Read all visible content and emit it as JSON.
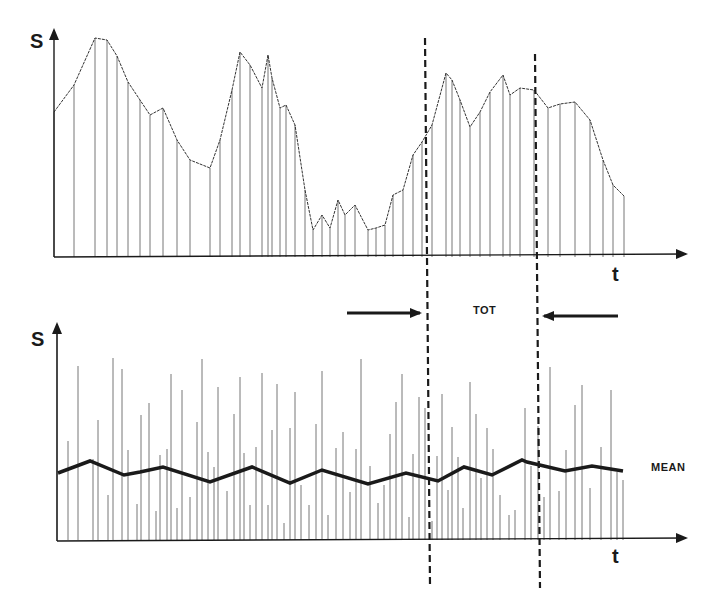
{
  "figure": {
    "top_panel": {
      "y_axis_label": "S",
      "x_axis_label": "t"
    },
    "bottom_panel": {
      "y_axis_label": "S",
      "x_axis_label": "t",
      "mean_label": "MEAN"
    },
    "window_label": "TOT",
    "colors": {
      "ink": "#1a1a1a",
      "stem": "#555555",
      "curve": "#333333",
      "background": "#ffffff"
    }
  },
  "chart_data": [
    {
      "type": "line",
      "title": "",
      "xlabel": "t",
      "ylabel": "S",
      "grid": false,
      "legend": "none",
      "note": "Schematic signal with no numeric axis. The values below are ESTIMATED SVG pixel coordinates I took from the image (y increases downward; baseline y=257). They are not data values shown in the figure.",
      "coordinate_system": "estimated-svg-pixels",
      "series": [
        {
          "name": "signal envelope (estimated waypoints)",
          "x": [
            54,
            74,
            95,
            107,
            117,
            128,
            140,
            150,
            163,
            177,
            190,
            210,
            220,
            232,
            240,
            250,
            262,
            268,
            272,
            280,
            286,
            295,
            305,
            313,
            322,
            330,
            338,
            345,
            355,
            368,
            376,
            385,
            393,
            403,
            413,
            422,
            432,
            446,
            452,
            460,
            470,
            480,
            490,
            503,
            510,
            520,
            534,
            548,
            560,
            575,
            590,
            603,
            613,
            624
          ],
          "y": [
            112,
            85,
            38,
            40,
            56,
            82,
            100,
            115,
            108,
            140,
            160,
            168,
            140,
            90,
            52,
            65,
            88,
            55,
            78,
            108,
            105,
            125,
            190,
            230,
            215,
            228,
            200,
            215,
            205,
            230,
            228,
            225,
            195,
            190,
            155,
            142,
            125,
            73,
            80,
            100,
            127,
            112,
            92,
            75,
            95,
            88,
            90,
            108,
            104,
            102,
            120,
            160,
            185,
            196
          ],
          "style": "thin dotted line with vertical sample stems to baseline"
        }
      ],
      "annotations": [
        {
          "type": "vline-dashed",
          "x_px": 427
        },
        {
          "type": "vline-dashed",
          "x_px": 537
        }
      ]
    },
    {
      "type": "line",
      "title": "",
      "xlabel": "t",
      "ylabel": "S",
      "grid": false,
      "legend": "inline label 'MEAN'",
      "note": "Random-height vertical sample lines plus a bold running-mean line. Stem and mean values below are ESTIMATED SVG pixel coordinates (baseline y=540), not values read from the figure.",
      "coordinate_system": "estimated-svg-pixels",
      "series": [
        {
          "name": "samples (estimated stem tops)",
          "x": [
            68,
            78,
            93,
            98,
            108,
            113,
            122,
            128,
            137,
            141,
            149,
            156,
            160,
            167,
            171,
            177,
            182,
            190,
            197,
            202,
            208,
            214,
            218,
            227,
            234,
            240,
            244,
            250,
            256,
            262,
            268,
            272,
            277,
            284,
            290,
            295,
            301,
            309,
            316,
            322,
            328,
            336,
            343,
            350,
            356,
            361,
            370,
            378,
            384,
            390,
            396,
            402,
            409,
            413,
            419,
            425,
            432,
            437,
            442,
            448,
            452,
            458,
            463,
            470,
            476,
            481,
            487,
            493,
            500,
            509,
            515,
            525,
            531,
            538,
            544,
            550,
            559,
            566,
            575,
            582,
            590,
            601,
            611,
            617,
            623
          ],
          "y": [
            441,
            366,
            459,
            420,
            495,
            358,
            369,
            450,
            504,
            415,
            403,
            511,
            455,
            449,
            374,
            508,
            390,
            497,
            422,
            359,
            452,
            467,
            387,
            491,
            414,
            377,
            453,
            505,
            447,
            373,
            505,
            430,
            384,
            523,
            428,
            392,
            485,
            505,
            424,
            371,
            515,
            448,
            432,
            492,
            449,
            359,
            466,
            503,
            485,
            434,
            402,
            374,
            517,
            454,
            397,
            408,
            521,
            456,
            394,
            490,
            427,
            457,
            508,
            382,
            414,
            478,
            428,
            449,
            495,
            515,
            510,
            408,
            466,
            426,
            497,
            367,
            491,
            450,
            405,
            385,
            488,
            447,
            390,
            472,
            480
          ],
          "style": "thin vertical lines"
        },
        {
          "name": "MEAN (estimated running mean)",
          "x": [
            58,
            90,
            124,
            140,
            163,
            210,
            252,
            290,
            322,
            368,
            406,
            438,
            464,
            492,
            522,
            527,
            565,
            592,
            623
          ],
          "y": [
            473,
            461,
            475,
            472,
            467,
            482,
            467,
            483,
            470,
            484,
            473,
            481,
            467,
            475,
            460,
            462,
            471,
            466,
            471
          ],
          "style": "bold solid line"
        }
      ],
      "annotations": [
        {
          "type": "vline-dashed",
          "x_px": 427
        },
        {
          "type": "vline-dashed",
          "x_px": 540
        },
        {
          "type": "arrow-right",
          "from_px": 347,
          "to_px": 418,
          "y_px": 312
        },
        {
          "type": "arrow-left",
          "from_px": 618,
          "to_px": 545,
          "y_px": 316
        },
        {
          "type": "text",
          "text": "TOT",
          "x_px": 475,
          "y_px": 312
        }
      ]
    }
  ]
}
